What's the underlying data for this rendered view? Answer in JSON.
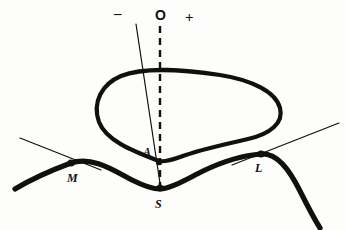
{
  "figure": {
    "background_color": "#fdfdfc",
    "ink_color": "#120f0d",
    "polarity_markers": [
      {
        "id": "negative",
        "label": "–",
        "x": 120,
        "y": 14
      },
      {
        "id": "origin",
        "label": "O",
        "x": 160,
        "y": 16
      },
      {
        "id": "positive",
        "label": "+",
        "x": 190,
        "y": 18
      }
    ],
    "point_labels": [
      {
        "id": "A",
        "label": "A",
        "x": 147,
        "y": 152
      },
      {
        "id": "M",
        "label": "M",
        "x": 72,
        "y": 178
      },
      {
        "id": "S",
        "label": "S",
        "x": 157,
        "y": 204
      },
      {
        "id": "L",
        "label": "L",
        "x": 258,
        "y": 168
      }
    ],
    "marked_points": [
      {
        "id": "point-m",
        "x": 71,
        "y": 163,
        "r": 3.6
      },
      {
        "id": "point-a",
        "x": 159,
        "y": 162,
        "r": 3.2
      },
      {
        "id": "point-s",
        "x": 160,
        "y": 188,
        "r": 3.6
      },
      {
        "id": "point-l",
        "x": 261,
        "y": 154,
        "r": 3.6
      }
    ],
    "lines": {
      "dashed_axis": {
        "id": "dashed-vertical-axis",
        "from": {
          "x": 160,
          "y": 26
        },
        "to": {
          "x": 160,
          "y": 192
        },
        "style": "dashed",
        "width": 2.4,
        "dash": "7 5"
      },
      "oblique_thin": {
        "id": "oblique-thin-line",
        "from": {
          "x": 136,
          "y": 24
        },
        "to": {
          "x": 161,
          "y": 190
        },
        "style": "solid",
        "width": 1.2
      },
      "tangent_m": {
        "id": "tangent-line-m",
        "from": {
          "x": 20,
          "y": 138
        },
        "to": {
          "x": 101,
          "y": 170
        },
        "style": "solid",
        "width": 1.2
      },
      "tangent_l": {
        "id": "tangent-line-l",
        "from": {
          "x": 232,
          "y": 165
        },
        "to": {
          "x": 339,
          "y": 123
        },
        "style": "solid",
        "width": 1.2
      }
    },
    "curves": {
      "closed_loop": {
        "id": "closed-loop",
        "shape": "bean",
        "width": 4.2,
        "path": "M 159 161 C 130 150 106 140 99 122 C 92 102 102 84 121 76 C 146 66 186 70 220 75 C 252 80 276 92 280 108 C 284 123 270 134 248 139 C 222 145 198 150 180 157 C 169 161 164 162 159 161 Z"
      },
      "profile_curve": {
        "id": "profile-curve",
        "width": 5.2,
        "path": "M 15 189 C 30 180 52 170 71 163 C 92 156 113 170 132 180 C 144 186 153 189 160 189 C 170 189 185 180 203 171 C 224 161 246 155 261 154 C 277 153 289 169 300 191 C 309 209 315 220 320 228"
      }
    }
  }
}
